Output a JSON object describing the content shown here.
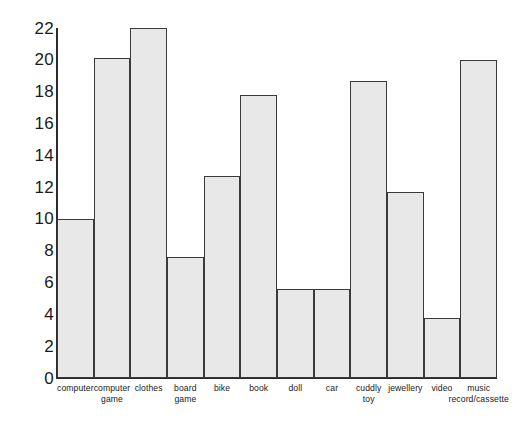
{
  "chart_data": {
    "type": "bar",
    "title": "",
    "subtitle": "",
    "xlabel": "",
    "ylabel": "",
    "ylim": [
      0,
      22
    ],
    "ytick_step": 2,
    "grid": false,
    "legend": false,
    "bar_fill_color": "#e8e8e8",
    "bar_edge_color": "#3a3a3a",
    "axis_color": "#2b2b2b",
    "background_color": "#ffffff",
    "ytick_labels": [
      "22",
      "20",
      "18",
      "16",
      "14",
      "12",
      "10",
      "8",
      "6",
      "4",
      "2",
      "0"
    ],
    "categories": [
      "computer",
      "computer game",
      "clothes",
      "board game",
      "bike",
      "book",
      "doll",
      "car",
      "cuddly toy",
      "jewellery",
      "video",
      "music record/cassette"
    ],
    "category_lines": [
      [
        "computer"
      ],
      [
        "computer",
        "game"
      ],
      [
        "clothes"
      ],
      [
        "board",
        "game"
      ],
      [
        "bike"
      ],
      [
        "book"
      ],
      [
        "doll"
      ],
      [
        "car"
      ],
      [
        "cuddly",
        "toy"
      ],
      [
        "jewellery"
      ],
      [
        "video"
      ],
      [
        "music",
        "record/cassette"
      ]
    ],
    "values": [
      10,
      20.1,
      22,
      7.6,
      12.7,
      17.8,
      5.6,
      5.6,
      18.7,
      11.7,
      3.8,
      20
    ]
  }
}
